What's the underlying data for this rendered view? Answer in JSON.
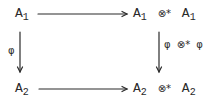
{
  "diagram": {
    "type": "commutative-square",
    "nodes": {
      "top_left": {
        "base": "A",
        "sub": "1"
      },
      "top_right": {
        "left_base": "A",
        "left_sub": "1",
        "op": "⊗*",
        "right_base": "A",
        "right_sub": "1"
      },
      "bottom_left": {
        "base": "A",
        "sub": "2"
      },
      "bottom_right": {
        "left_base": "A",
        "left_sub": "2",
        "op": "⊗*",
        "right_base": "A",
        "right_sub": "2"
      }
    },
    "arrows": {
      "left_label": "φ",
      "right_label": "φ ⊗* φ",
      "top_label": "",
      "bottom_label": ""
    },
    "color": "#2a2a2a"
  }
}
